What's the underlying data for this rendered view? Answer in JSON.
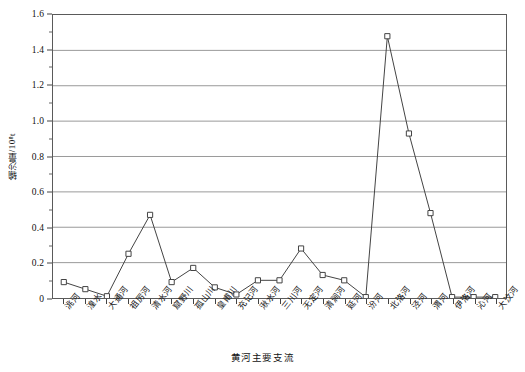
{
  "chart_data": {
    "type": "line",
    "title": "",
    "xlabel": "黄河主要支流",
    "ylabel": "输沙量/10⁸t",
    "ylim": [
      0,
      1.6
    ],
    "ytick_values": [
      0,
      0.2,
      0.4,
      0.6,
      0.8,
      1.0,
      1.2,
      1.4,
      1.6
    ],
    "ytick_labels": [
      "0",
      "0.2",
      "0.4",
      "0.6",
      "0.8",
      "1.0",
      "1.2",
      "1.4",
      "1.6"
    ],
    "yminor_step": 0.1,
    "grid": "horizontal",
    "legend": "none",
    "marker": "open-square",
    "line_color": "#444444",
    "marker_color": "#ffffff",
    "grid_color": "#9a9a9a",
    "categories": [
      "洮河",
      "湟水",
      "大通河",
      "祖厉河",
      "清水河",
      "窟野川",
      "孤山川",
      "皇甫川",
      "充记河",
      "湫水河",
      "三川河",
      "无定河",
      "清涧河",
      "延河",
      "汾河",
      "北洛河",
      "泾河",
      "渭河",
      "伊洛河",
      "沁河",
      "大汶河"
    ],
    "values": [
      0.09,
      0.05,
      0.01,
      0.25,
      0.47,
      0.09,
      0.17,
      0.06,
      0.02,
      0.1,
      0.1,
      0.28,
      0.13,
      0.1,
      0.005,
      1.48,
      0.93,
      0.48,
      0.005,
      0.005,
      0.005
    ],
    "series": [
      {
        "name": "输沙量",
        "values": [
          0.09,
          0.05,
          0.01,
          0.25,
          0.47,
          0.09,
          0.17,
          0.06,
          0.02,
          0.1,
          0.1,
          0.28,
          0.13,
          0.1,
          0.005,
          1.48,
          0.93,
          0.48,
          0.005,
          0.005,
          0.005
        ]
      }
    ]
  }
}
